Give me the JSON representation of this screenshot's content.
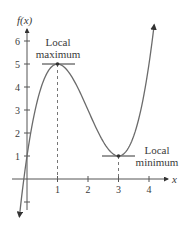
{
  "chart_data": {
    "type": "line",
    "title": "",
    "function": "f(x) = x^3 - 6x^2 + 9x + 1",
    "xlabel": "x",
    "ylabel": "f(x)",
    "x_ticks": [
      1,
      2,
      3,
      4
    ],
    "y_ticks": [
      1,
      2,
      3,
      4,
      5,
      6
    ],
    "xlim": [
      -0.25,
      4.2
    ],
    "ylim": [
      -1.2,
      6.3
    ],
    "grid": false,
    "legend": null,
    "series": [
      {
        "name": "f(x)",
        "x": [
          -0.23,
          0,
          0.5,
          1,
          1.5,
          2,
          2.5,
          3,
          3.5,
          4,
          4.15
        ],
        "y": [
          -1.4,
          1,
          4.125,
          5,
          4.375,
          3,
          1.625,
          1,
          1.875,
          5,
          5.85
        ]
      }
    ],
    "annotations": [
      {
        "text_line1": "Local",
        "text_line2": "maximum",
        "x": 1,
        "y": 5
      },
      {
        "text_line1": "Local",
        "text_line2": "minimum",
        "x": 3,
        "y": 1
      }
    ],
    "colors": {
      "curve": "#6b6b6b",
      "axis": "#555555",
      "text": "#3a3a3a"
    }
  }
}
